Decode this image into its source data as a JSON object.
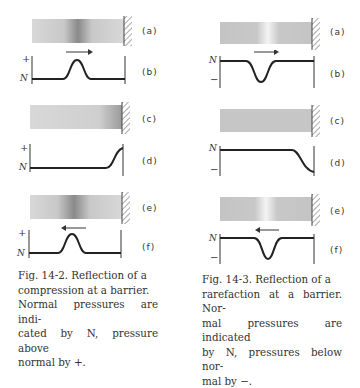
{
  "figures": [
    {
      "id": "fig-14-2",
      "caption_num": "Fig. 14-2.",
      "caption_lines": [
        "Fig. 14-2.  Reflection of a",
        "compression at a barrier.",
        "Normal pressures are indi-",
        "cated by N, pressure above",
        "normal by +."
      ],
      "panels": {
        "a": "(a)",
        "b": "(b)",
        "c": "(c)",
        "d": "(d)",
        "e": "(e)",
        "f": "(f)"
      },
      "axis": {
        "normal": "N",
        "sign": "+"
      },
      "pulse": "compression",
      "arrow_b": "right",
      "arrow_f": "left"
    },
    {
      "id": "fig-14-3",
      "caption_lines": [
        "Fig. 14-3.  Reflection of a",
        "rarefaction at a barrier. Nor-",
        "mal pressures are indicated",
        "by N, pressures below nor-",
        "mal by −."
      ],
      "panels": {
        "a": "(a)",
        "b": "(b)",
        "c": "(c)",
        "d": "(d)",
        "e": "(e)",
        "f": "(f)"
      },
      "axis": {
        "normal": "N",
        "sign": "−"
      },
      "pulse": "rarefaction",
      "arrow_b": "right",
      "arrow_f": "left"
    }
  ],
  "colors": {
    "ink": "#222222",
    "gray": "#b8b8b8"
  }
}
